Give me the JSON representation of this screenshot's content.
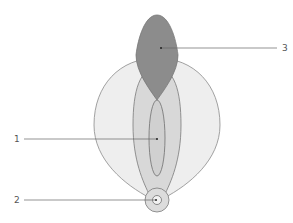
{
  "diagram": {
    "labels": [
      {
        "id": "1",
        "text": "1"
      },
      {
        "id": "2",
        "text": "2"
      },
      {
        "id": "3",
        "text": "3"
      }
    ],
    "colors": {
      "background": "#ffffff",
      "outer_shape": "#eeeeee",
      "middle_lobe": "#d8d8d8",
      "inner_ellipse": "#d0d0d0",
      "top_shape": "#8c8c8c",
      "ring_outer": "#dcdcdc",
      "ring_inner": "#f2f2f2",
      "stroke": "#7a7a7a",
      "leader_line": "#666666"
    }
  }
}
